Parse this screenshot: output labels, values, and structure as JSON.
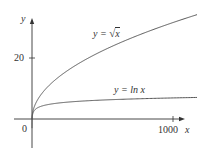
{
  "chart_data": {
    "type": "line",
    "title": "",
    "xlabel": "x",
    "ylabel": "y",
    "x_ticks": [
      0,
      1000
    ],
    "y_ticks": [
      0,
      20
    ],
    "xlim": [
      0,
      1170
    ],
    "ylim": [
      -10,
      32
    ],
    "grid": false,
    "legend": "inline labels on curves",
    "series": [
      {
        "name": "y = √x",
        "function": "sqrt(x)",
        "x": [
          0,
          50,
          100,
          200,
          400,
          600,
          800,
          1000,
          1170
        ],
        "y": [
          0,
          7.07,
          10,
          14.14,
          20,
          24.49,
          28.28,
          31.62,
          34.21
        ]
      },
      {
        "name": "y = ln x",
        "function": "ln(x)",
        "x": [
          1,
          10,
          50,
          100,
          200,
          400,
          600,
          800,
          1000,
          1170
        ],
        "y": [
          0,
          2.3,
          3.91,
          4.61,
          5.3,
          5.99,
          6.4,
          6.68,
          6.91,
          7.06
        ]
      }
    ]
  },
  "labels": {
    "y_axis": "y",
    "x_axis": "x",
    "origin": "0",
    "y_tick_20": "20",
    "x_tick_1000": "1000",
    "sqrt_prefix": "y = ",
    "sqrt_radicand": "x",
    "ln_label": "y = ln x"
  },
  "colors": {
    "axis": "#333333",
    "curve": "#555555"
  }
}
